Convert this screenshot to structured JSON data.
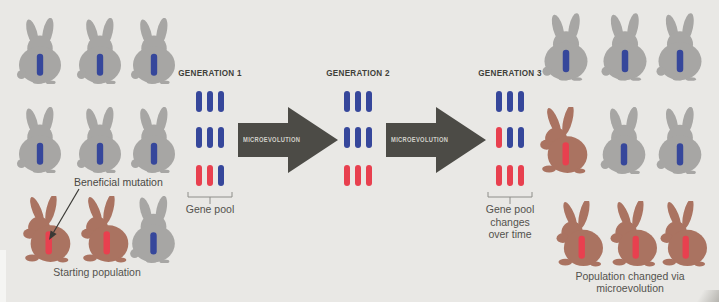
{
  "figure": {
    "background": "#e9e8e5"
  },
  "colors": {
    "rabbit_gray": "#a7a6a4",
    "rabbit_brown": "#aa7361",
    "allele_blue": "#36479b",
    "allele_red": "#e8404f",
    "arrow_fill": "#4c4b46",
    "arrow_text": "#d2d1cb",
    "label_text": "#53524d",
    "generation_text": "#403f3a",
    "bracket": "#8e8e8a"
  },
  "generations": [
    {
      "label": "GENERATION 1",
      "rows": [
        [
          "blue",
          "blue",
          "blue"
        ],
        [
          "blue",
          "blue",
          "blue"
        ],
        [
          "red",
          "red",
          "blue"
        ]
      ],
      "caption_lines": [
        "Gene pool"
      ]
    },
    {
      "label": "GENERATION 2",
      "rows": [
        [
          "blue",
          "blue",
          "blue"
        ],
        [
          "blue",
          "blue",
          "blue"
        ],
        [
          "red",
          "red",
          "red"
        ]
      ],
      "caption_lines": []
    },
    {
      "label": "GENERATION 3",
      "rows": [
        [
          "blue",
          "blue",
          "blue"
        ],
        [
          "red",
          "blue",
          "blue"
        ],
        [
          "red",
          "red",
          "red"
        ]
      ],
      "caption_lines": [
        "Gene pool",
        "changes",
        "over time"
      ]
    }
  ],
  "arrows": [
    {
      "label": "MICROEVOLUTION"
    },
    {
      "label": "MICROEVOLUTION"
    }
  ],
  "left_population": {
    "annotation": "Beneficial mutation",
    "caption": "Starting population",
    "rows": [
      [
        {
          "body": "gray",
          "allele": "blue"
        },
        {
          "body": "gray",
          "allele": "blue"
        },
        {
          "body": "gray",
          "allele": "blue"
        }
      ],
      [
        {
          "body": "gray",
          "allele": "blue"
        },
        {
          "body": "gray",
          "allele": "blue"
        },
        {
          "body": "gray",
          "allele": "blue"
        }
      ],
      [
        {
          "body": "brown",
          "allele": "red"
        },
        {
          "body": "brown",
          "allele": "red"
        },
        {
          "body": "gray",
          "allele": "blue"
        }
      ]
    ]
  },
  "right_population": {
    "caption_lines": [
      "Population changed via",
      "microevolution"
    ],
    "rows": [
      [
        {
          "body": "gray",
          "allele": "blue"
        },
        {
          "body": "gray",
          "allele": "blue"
        },
        {
          "body": "gray",
          "allele": "blue"
        }
      ],
      [
        {
          "body": "brown",
          "allele": "red"
        },
        {
          "body": "gray",
          "allele": "blue"
        },
        {
          "body": "gray",
          "allele": "blue"
        }
      ],
      [
        {
          "body": "brown",
          "allele": "red"
        },
        {
          "body": "brown",
          "allele": "red"
        },
        {
          "body": "brown",
          "allele": "red"
        }
      ]
    ]
  }
}
